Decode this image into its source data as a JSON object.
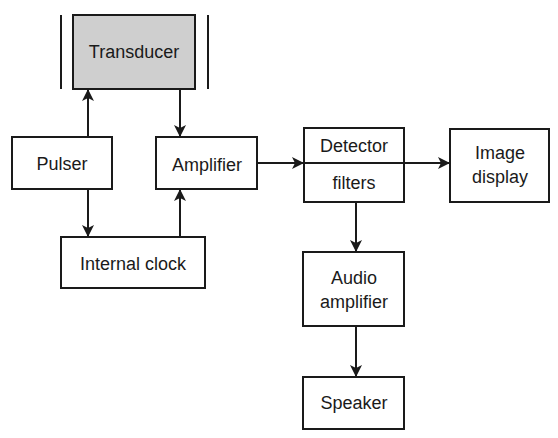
{
  "diagram": {
    "type": "block-diagram",
    "blocks": {
      "transducer": {
        "label": "Transducer",
        "fill": "#cfcfcf"
      },
      "pulser": {
        "label": "Pulser"
      },
      "amplifier": {
        "label": "Amplifier"
      },
      "internal_clock": {
        "label": "Internal clock"
      },
      "detector": {
        "label_top": "Detector",
        "label_bottom": "filters"
      },
      "image_display": {
        "label_line1": "Image",
        "label_line2": "display"
      },
      "audio_amplifier": {
        "label_line1": "Audio",
        "label_line2": "amplifier"
      },
      "speaker": {
        "label": "Speaker"
      }
    },
    "connections": [
      {
        "from": "Pulser",
        "to": "Transducer"
      },
      {
        "from": "Transducer",
        "to": "Amplifier"
      },
      {
        "from": "Pulser",
        "to": "Internal clock"
      },
      {
        "from": "Internal clock",
        "to": "Amplifier"
      },
      {
        "from": "Amplifier",
        "to": "Detector filters"
      },
      {
        "from": "Detector filters",
        "to": "Image display"
      },
      {
        "from": "Detector filters",
        "to": "Audio amplifier"
      },
      {
        "from": "Audio amplifier",
        "to": "Speaker"
      }
    ]
  }
}
